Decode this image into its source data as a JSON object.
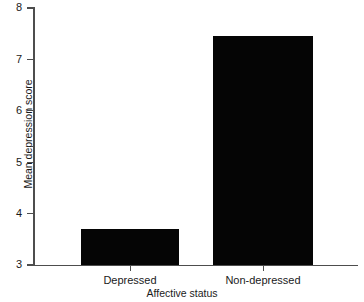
{
  "chart_data": {
    "type": "bar",
    "title": "",
    "xlabel": "Affective status",
    "ylabel": "Mean depression score",
    "categories": [
      "Depressed",
      "Non-depressed"
    ],
    "values": [
      3.7,
      7.45
    ],
    "ylim": [
      3,
      8
    ],
    "yticks": [
      3,
      4,
      5,
      6,
      7,
      8
    ],
    "ytick_labels": [
      "3",
      "4",
      "5",
      "6",
      "7",
      "8"
    ],
    "grid": false,
    "legend": null,
    "bar_color": "#050505",
    "axis_color": "#4d4d4d",
    "background_color": "#ffffff"
  },
  "axis": {
    "y_labels": {
      "t3": "3",
      "t4": "4",
      "t5": "5",
      "t6": "6",
      "t7": "7",
      "t8": "8"
    },
    "x_labels": {
      "c0": "Depressed",
      "c1": "Non-depressed"
    },
    "titles": {
      "x": "Affective status",
      "y": "Mean depression score"
    }
  }
}
